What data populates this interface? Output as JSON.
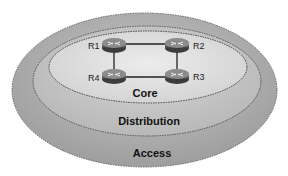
{
  "diagram": {
    "layers": [
      {
        "id": "access",
        "label": "Access",
        "fill": "#a9a9a9"
      },
      {
        "id": "distribution",
        "label": "Distribution",
        "fill": "#c4c4c4"
      },
      {
        "id": "core",
        "label": "Core",
        "fill": "#dcdcdc"
      }
    ],
    "routers": [
      {
        "id": "R1",
        "label": "R1"
      },
      {
        "id": "R2",
        "label": "R2"
      },
      {
        "id": "R3",
        "label": "R3"
      },
      {
        "id": "R4",
        "label": "R4"
      }
    ],
    "links": [
      [
        "R1",
        "R2"
      ],
      [
        "R2",
        "R3"
      ],
      [
        "R3",
        "R4"
      ],
      [
        "R4",
        "R1"
      ]
    ],
    "colors": {
      "outline": "#555555",
      "router_body": "#4a4a4a",
      "router_top": "#8a8a8a",
      "link": "#222222"
    }
  }
}
